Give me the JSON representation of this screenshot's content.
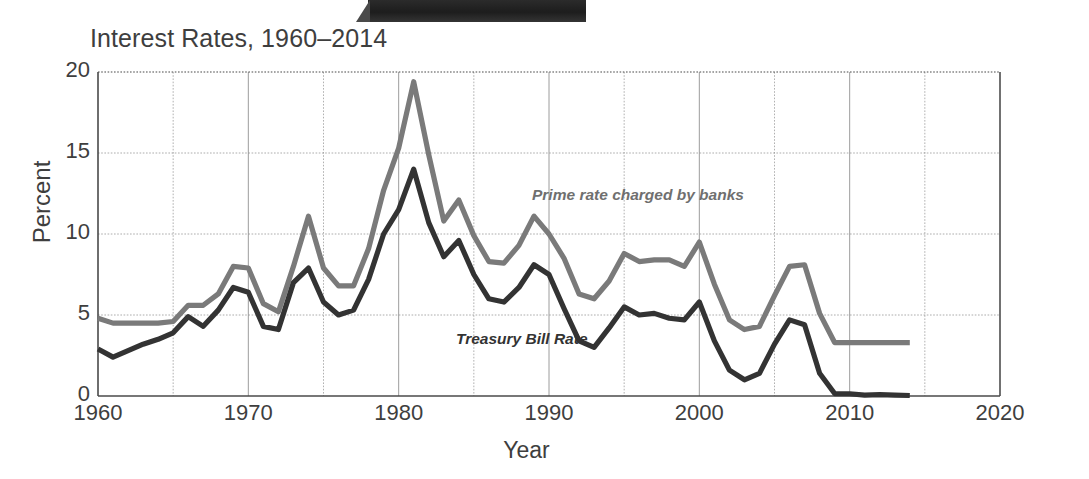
{
  "chart_data": {
    "type": "line",
    "title": "Interest Rates, 1960–2014",
    "xlabel": "Year",
    "ylabel": "Percent",
    "xlim": [
      1960,
      2020
    ],
    "ylim": [
      0,
      20
    ],
    "xticks": [
      1960,
      1970,
      1980,
      1990,
      2000,
      2010,
      2020
    ],
    "yticks": [
      0,
      5,
      10,
      15,
      20
    ],
    "xtick_labels": [
      "1960",
      "1970",
      "1980",
      "1990",
      "2000",
      "2010",
      "2020"
    ],
    "ytick_labels": [
      "0",
      "5",
      "10",
      "15",
      "20"
    ],
    "grid": true,
    "minor_x_gridlines": [
      1965,
      1975,
      1985,
      1995,
      2005,
      2015
    ],
    "legend": "inline-annotations",
    "x": [
      1960,
      1961,
      1962,
      1963,
      1964,
      1965,
      1966,
      1967,
      1968,
      1969,
      1970,
      1971,
      1972,
      1973,
      1974,
      1975,
      1976,
      1977,
      1978,
      1979,
      1980,
      1981,
      1982,
      1983,
      1984,
      1985,
      1986,
      1987,
      1988,
      1989,
      1990,
      1991,
      1992,
      1993,
      1994,
      1995,
      1996,
      1997,
      1998,
      1999,
      2000,
      2001,
      2002,
      2003,
      2004,
      2005,
      2006,
      2007,
      2008,
      2009,
      2010,
      2011,
      2012,
      2013,
      2014
    ],
    "series": [
      {
        "name": "Prime rate charged by banks",
        "color": "#7a7a7a",
        "annotation": "Prime rate charged by banks",
        "values": [
          4.8,
          4.5,
          4.5,
          4.5,
          4.5,
          4.6,
          5.6,
          5.6,
          6.3,
          8.0,
          7.9,
          5.7,
          5.2,
          8.0,
          11.1,
          7.9,
          6.8,
          6.8,
          9.1,
          12.7,
          15.3,
          19.4,
          14.9,
          10.8,
          12.1,
          9.9,
          8.3,
          8.2,
          9.3,
          11.1,
          10.0,
          8.5,
          6.3,
          6.0,
          7.1,
          8.8,
          8.3,
          8.4,
          8.4,
          8.0,
          9.5,
          6.9,
          4.7,
          4.1,
          4.3,
          6.2,
          8.0,
          8.1,
          5.1,
          3.3,
          3.3,
          3.3,
          3.3,
          3.3,
          3.3
        ]
      },
      {
        "name": "Treasury Bill Rate",
        "color": "#333333",
        "annotation": "Treasury Bill Rate",
        "values": [
          2.9,
          2.4,
          2.8,
          3.2,
          3.5,
          3.9,
          4.9,
          4.3,
          5.3,
          6.7,
          6.4,
          4.3,
          4.1,
          7.0,
          7.9,
          5.8,
          5.0,
          5.3,
          7.2,
          10.0,
          11.5,
          14.0,
          10.7,
          8.6,
          9.6,
          7.5,
          6.0,
          5.8,
          6.7,
          8.1,
          7.5,
          5.4,
          3.4,
          3.0,
          4.2,
          5.5,
          5.0,
          5.1,
          4.8,
          4.7,
          5.8,
          3.4,
          1.6,
          1.0,
          1.4,
          3.2,
          4.7,
          4.4,
          1.4,
          0.15,
          0.14,
          0.05,
          0.09,
          0.06,
          0.03
        ]
      }
    ]
  },
  "axes": {
    "y_title": "Percent",
    "x_title": "Year"
  },
  "title": "Interest Rates, 1960–2014",
  "colors": {
    "prime": "#7a7a7a",
    "treasury": "#333333",
    "axis": "#4a4a4a",
    "grid": "#8d8d8d",
    "text": "#3e3e3e"
  }
}
